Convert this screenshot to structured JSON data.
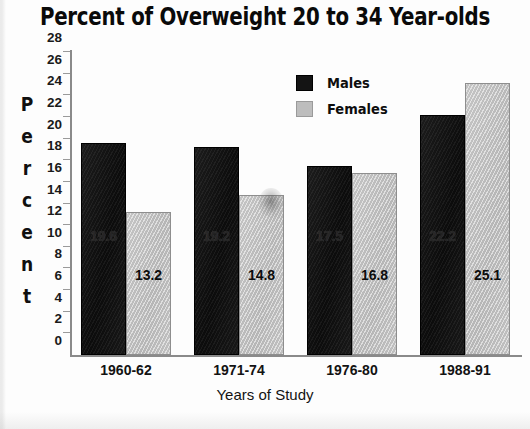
{
  "chart_data": {
    "type": "bar",
    "title": "Percent of Overweight 20 to 34 Year-olds",
    "xlabel": "Years of Study",
    "ylabel": "Percent",
    "categories": [
      "1960-62",
      "1971-74",
      "1976-80",
      "1988-91"
    ],
    "series": [
      {
        "name": "Males",
        "color": "#141414",
        "values": [
          19.6,
          19.2,
          17.5,
          22.2
        ],
        "labels": [
          "19.6",
          "19.2",
          "17.5",
          "22.2"
        ]
      },
      {
        "name": "Females",
        "color": "#bdbdbd",
        "values": [
          13.2,
          14.8,
          16.8,
          25.1
        ],
        "labels": [
          "13.2",
          "14.8",
          "16.8",
          "25.1"
        ]
      }
    ],
    "ylim": [
      0,
      28
    ],
    "ytick_step": 2,
    "yticks": [
      "0",
      "2",
      "4",
      "6",
      "8",
      "10",
      "12",
      "14",
      "16",
      "18",
      "20",
      "22",
      "24",
      "26",
      "28"
    ],
    "grid": false,
    "legend_position": "top-center"
  },
  "legend": {
    "items": [
      {
        "label": "Males",
        "swatch": "male"
      },
      {
        "label": "Females",
        "swatch": "female"
      }
    ]
  }
}
